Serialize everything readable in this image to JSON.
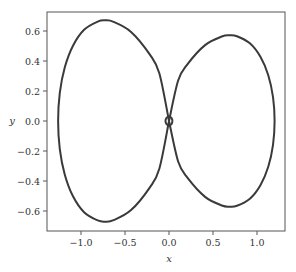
{
  "chart_data": {
    "type": "line",
    "title": "",
    "xlabel": "x",
    "ylabel": "y",
    "xlim": [
      -1.4,
      1.32
    ],
    "ylim": [
      -0.73,
      0.73
    ],
    "grid": false,
    "legend": null,
    "xticks": [
      -1.0,
      -0.5,
      0.0,
      0.5,
      1.0
    ],
    "xtick_labels": [
      "−1.0",
      "−0.5",
      "0.0",
      "0.5",
      "1.0"
    ],
    "yticks": [
      0.6,
      0.4,
      0.2,
      0.0,
      -0.2,
      -0.4,
      -0.6
    ],
    "ytick_labels": [
      "0.6",
      "0.4",
      "0.2",
      "0.0",
      "−0.2",
      "−0.4",
      "−0.6"
    ],
    "line_color": "#3a3a3a",
    "series": [
      {
        "name": "left-lobe",
        "x": [
          0,
          -0.11,
          -0.219,
          -0.431,
          -0.63,
          -0.723,
          -0.81,
          -0.965,
          -1.091,
          -1.184,
          -1.241,
          -1.26,
          -1.241,
          -1.184,
          -1.091,
          -0.965,
          -0.81,
          -0.723,
          -0.63,
          -0.431,
          -0.219,
          -0.11,
          0
        ],
        "y": [
          0,
          0.318,
          0.444,
          0.594,
          0.661,
          0.671,
          0.663,
          0.608,
          0.502,
          0.358,
          0.187,
          0,
          -0.187,
          -0.358,
          -0.502,
          -0.608,
          -0.663,
          -0.671,
          -0.661,
          -0.594,
          -0.444,
          -0.318,
          0
        ]
      },
      {
        "name": "right-lobe",
        "x": [
          0,
          0.104,
          0.209,
          0.41,
          0.6,
          0.689,
          0.772,
          0.919,
          1.039,
          1.128,
          1.182,
          1.2,
          1.182,
          1.128,
          1.039,
          0.919,
          0.772,
          0.689,
          0.6,
          0.41,
          0.209,
          0.104,
          0
        ],
        "y": [
          0,
          0.27,
          0.378,
          0.506,
          0.563,
          0.571,
          0.565,
          0.518,
          0.428,
          0.305,
          0.159,
          0,
          -0.159,
          -0.305,
          -0.428,
          -0.518,
          -0.565,
          -0.571,
          -0.563,
          -0.506,
          -0.378,
          -0.27,
          0
        ]
      },
      {
        "name": "center-loop",
        "x": [
          0.04,
          0.028,
          0,
          -0.028,
          -0.04,
          -0.028,
          0,
          0.028,
          0.04
        ],
        "y": [
          0,
          0.021,
          0.03,
          0.021,
          0,
          -0.021,
          -0.03,
          -0.021,
          0
        ]
      }
    ]
  }
}
